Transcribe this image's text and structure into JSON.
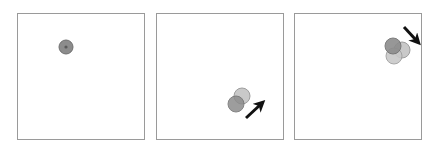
{
  "figure": {
    "width": 440,
    "height": 152,
    "background": "#ffffff",
    "panel_border_color": "#9a9a9a",
    "panel_border_width": 1,
    "panel_fill": "#ffffff"
  },
  "colors": {
    "circle_dark_fill": "#8c8c8c",
    "circle_dark_stroke": "#6f6f6f",
    "circle_light_fill": "#c9c9c9",
    "circle_light_stroke": "#9e9e9e",
    "circle_mid_fill": "#aaaaaa",
    "circle_mid_stroke": "#8a8a8a",
    "dot_center": "#5a5a5a",
    "arrow": "#111111"
  },
  "panels": [
    {
      "id": "panel-1",
      "index": 1,
      "label": "frame-1",
      "x": 17,
      "y": 13,
      "width": 128,
      "height": 127,
      "circles": [
        {
          "name": "circle-dark",
          "cx": 66,
          "cy": 47,
          "r": 7,
          "fill": "#8c8c8c",
          "stroke": "#6f6f6f",
          "opacity": 1
        }
      ],
      "center_dot": {
        "cx": 66,
        "cy": 47,
        "r": 1.6,
        "fill": "#5a5a5a"
      },
      "arrow": null
    },
    {
      "id": "panel-2",
      "index": 2,
      "label": "frame-2",
      "x": 156,
      "y": 13,
      "width": 128,
      "height": 127,
      "circles": [
        {
          "name": "circle-light",
          "cx": 242,
          "cy": 96,
          "r": 8,
          "fill": "#c9c9c9",
          "stroke": "#9e9e9e",
          "opacity": 1
        },
        {
          "name": "circle-dark",
          "cx": 236,
          "cy": 104,
          "r": 8,
          "fill": "#8c8c8c",
          "stroke": "#6f6f6f",
          "opacity": 0.85
        }
      ],
      "center_dot": null,
      "arrow": {
        "name": "motion-arrow-northeast",
        "direction": "northeast",
        "x1": 246,
        "y1": 118,
        "x2": 260,
        "y2": 105,
        "color": "#111111",
        "width": 3
      }
    },
    {
      "id": "panel-3",
      "index": 3,
      "label": "frame-3",
      "x": 294,
      "y": 13,
      "width": 128,
      "height": 127,
      "circles": [
        {
          "name": "circle-light-right",
          "cx": 402,
          "cy": 50,
          "r": 8,
          "fill": "#c9c9c9",
          "stroke": "#9e9e9e",
          "opacity": 1
        },
        {
          "name": "circle-light-bottom",
          "cx": 394,
          "cy": 56,
          "r": 8,
          "fill": "#c9c9c9",
          "stroke": "#9e9e9e",
          "opacity": 0.9
        },
        {
          "name": "circle-dark-top",
          "cx": 393,
          "cy": 46,
          "r": 8,
          "fill": "#8c8c8c",
          "stroke": "#6f6f6f",
          "opacity": 0.9
        }
      ],
      "center_dot": null,
      "arrow": {
        "name": "motion-arrow-southeast",
        "direction": "southeast",
        "x1": 404,
        "y1": 27,
        "x2": 416,
        "y2": 40,
        "color": "#111111",
        "width": 3
      }
    }
  ]
}
